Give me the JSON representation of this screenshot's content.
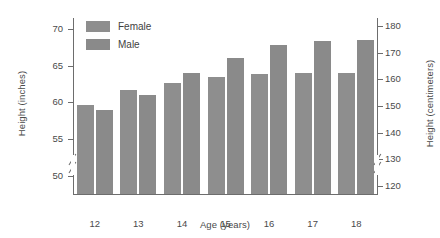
{
  "chart_data": {
    "type": "bar",
    "title": "",
    "categories": [
      "12",
      "13",
      "14",
      "15",
      "16",
      "17",
      "18"
    ],
    "series": [
      {
        "name": "Female",
        "values": [
          59.7,
          61.7,
          62.7,
          63.4,
          63.9,
          64.0,
          64.0
        ],
        "color": "#8e8e8e"
      },
      {
        "name": "Male",
        "values": [
          58.9,
          61.0,
          64.0,
          66.0,
          67.8,
          68.4,
          68.5
        ],
        "color": "#8a8a8a"
      }
    ],
    "xlabel": "Age (years)",
    "ylabel": "Height (inches)",
    "ylabel_right": "Height (centimeters)",
    "ylim": [
      47.5,
      71.5
    ],
    "yticks": [
      50,
      55,
      60,
      65,
      70
    ],
    "yticks_right": [
      120,
      130,
      140,
      150,
      160,
      170,
      180
    ],
    "ylim_right": [
      117,
      183
    ],
    "grid": false,
    "axis_break_left": true,
    "axis_break_right": true,
    "legend_position": "top-left"
  },
  "legend": {
    "items": [
      {
        "label": "Female",
        "color": "#8e8e8e"
      },
      {
        "label": "Male",
        "color": "#8a8a8a"
      }
    ]
  },
  "axes": {
    "left": {
      "title": "Height (inches)",
      "tick_labels": [
        "70",
        "65",
        "60",
        "55",
        "50"
      ]
    },
    "right": {
      "title": "Height (centimeters)",
      "tick_labels": [
        "180",
        "170",
        "160",
        "150",
        "140",
        "130",
        "120"
      ]
    },
    "bottom": {
      "title": "Age (years)",
      "tick_labels": [
        "12",
        "13",
        "14",
        "15",
        "16",
        "17",
        "18"
      ]
    }
  }
}
